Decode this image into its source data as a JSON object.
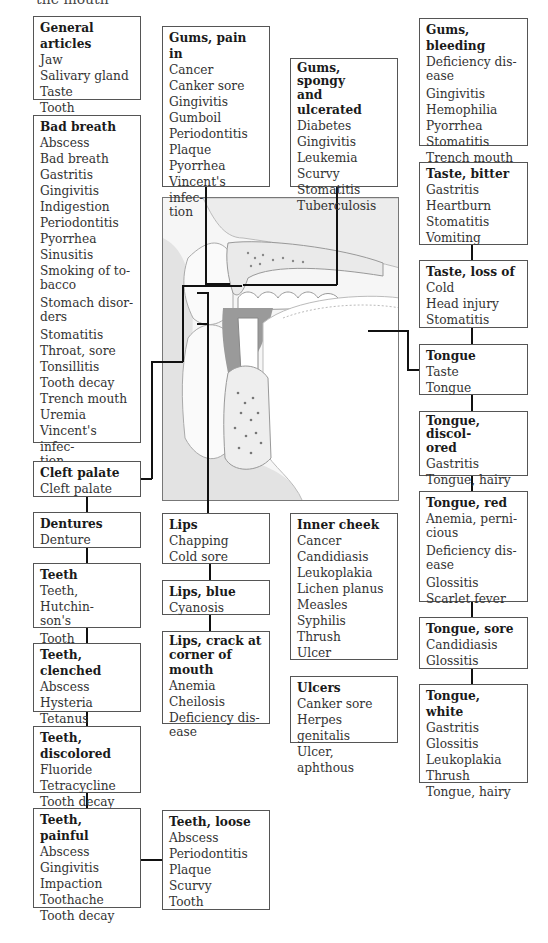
{
  "page": {
    "cut_heading": "the mouth"
  },
  "illustration": {
    "subject": "cross-section of mouth, teeth, tongue and palate",
    "icon": "mouth-anatomy-illustration"
  },
  "boxes": {
    "general_articles": {
      "title": "General articles",
      "items": [
        "Jaw",
        "Salivary gland",
        "Taste",
        "Tooth"
      ]
    },
    "bad_breath": {
      "title": "Bad breath",
      "items": [
        "Abscess",
        "Bad breath",
        "Gastritis",
        "Gingivitis",
        "Indigestion",
        "Periodontitis",
        "Pyorrhea",
        "Sinusitis",
        "Smoking of to-",
        "bacco",
        "Stomach disor-",
        "ders",
        "Stomatitis",
        "Throat, sore",
        "Tonsillitis",
        "Tooth decay",
        "Trench mouth",
        "Uremia",
        "Vincent's infec-",
        "tion"
      ]
    },
    "cleft_palate": {
      "title": "Cleft palate",
      "items": [
        "Cleft palate"
      ]
    },
    "dentures": {
      "title": "Dentures",
      "items": [
        "Denture"
      ]
    },
    "teeth": {
      "title": "Teeth",
      "items": [
        "Teeth, Hutchin-",
        "son's",
        "Tooth"
      ]
    },
    "teeth_clenched": {
      "title": "Teeth, clenched",
      "items": [
        "Abscess",
        "Hysteria",
        "Tetanus"
      ]
    },
    "teeth_discolored": {
      "title": "Teeth, discolored",
      "items": [
        "Fluoride",
        "Tetracycline",
        "Tooth decay"
      ]
    },
    "teeth_painful": {
      "title": "Teeth, painful",
      "items": [
        "Abscess",
        "Gingivitis",
        "Impaction",
        "Toothache",
        "Tooth decay"
      ]
    },
    "teeth_loose": {
      "title": "Teeth, loose",
      "items": [
        "Abscess",
        "Periodontitis",
        "Plaque",
        "Scurvy",
        "Tooth"
      ]
    },
    "gums_pain": {
      "title": "Gums, pain in",
      "items": [
        "Cancer",
        "Canker sore",
        "Gingivitis",
        "Gumboil",
        "Periodontitis",
        "Plaque",
        "Pyorrhea",
        "Vincent's infec-",
        "tion"
      ]
    },
    "gums_spongy": {
      "title_lines": [
        "Gums, spongy",
        "and ulcerated"
      ],
      "items": [
        "Diabetes",
        "Gingivitis",
        "Leukemia",
        "Scurvy",
        "Stomatitis",
        "Tuberculosis"
      ]
    },
    "gums_bleeding": {
      "title": "Gums, bleeding",
      "items": [
        "Deficiency dis-",
        "ease",
        "Gingivitis",
        "Hemophilia",
        "Pyorrhea",
        "Stomatitis",
        "Trench mouth"
      ]
    },
    "taste_bitter": {
      "title": "Taste, bitter",
      "items": [
        "Gastritis",
        "Heartburn",
        "Stomatitis",
        "Vomiting"
      ]
    },
    "taste_loss": {
      "title": "Taste, loss of",
      "items": [
        "Cold",
        "Head injury",
        "Stomatitis"
      ]
    },
    "tongue": {
      "title": "Tongue",
      "items": [
        "Taste",
        "Tongue"
      ]
    },
    "tongue_discolored": {
      "title_lines": [
        "Tongue, discol-",
        "ored"
      ],
      "items": [
        "Gastritis",
        "Tongue, hairy"
      ]
    },
    "tongue_red": {
      "title": "Tongue, red",
      "items": [
        "Anemia, perni-",
        "cious",
        "Deficiency dis-",
        "ease",
        "Glossitis",
        "Scarlet fever"
      ]
    },
    "tongue_sore": {
      "title": "Tongue, sore",
      "items": [
        "Candidiasis",
        "Glossitis"
      ]
    },
    "tongue_white": {
      "title": "Tongue, white",
      "items": [
        "Gastritis",
        "Glossitis",
        "Leukoplakia",
        "Thrush",
        "Tongue, hairy"
      ]
    },
    "lips": {
      "title": "Lips",
      "items": [
        "Chapping",
        "Cold sore"
      ]
    },
    "lips_blue": {
      "title": "Lips, blue",
      "items": [
        "Cyanosis"
      ]
    },
    "lips_crack": {
      "title_lines": [
        "Lips, crack at",
        "corner of mouth"
      ],
      "items": [
        "Anemia",
        "Cheilosis",
        "Deficiency dis-",
        "ease"
      ]
    },
    "inner_cheek": {
      "title": "Inner cheek",
      "items": [
        "Cancer",
        "Candidiasis",
        "Leukoplakia",
        "Lichen planus",
        "Measles",
        "Syphilis",
        "Thrush",
        "Ulcer"
      ]
    },
    "ulcers": {
      "title": "Ulcers",
      "items": [
        "Canker sore",
        "Herpes genitalis",
        "Ulcer, aphthous"
      ]
    }
  },
  "colors": {
    "box_border": "#555555",
    "connector": "#111111",
    "illustration_bg": "#f4f4f4",
    "text": "#333333"
  }
}
